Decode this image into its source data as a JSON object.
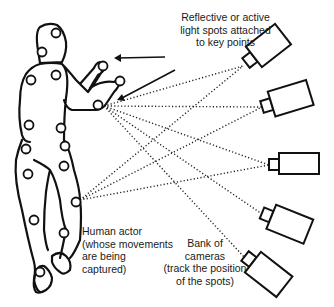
{
  "diagram": {
    "labels": {
      "markers": {
        "lines": [
          "Reflective or active",
          "light spots attached",
          "to key points"
        ]
      },
      "actor": {
        "lines": [
          "Human actor",
          "(whose movements",
          "are being",
          "captured)"
        ]
      },
      "cameras": {
        "lines": [
          "Bank of",
          "cameras",
          "(track the position",
          "of the spots)"
        ]
      }
    },
    "elements": {
      "actor_figure": "human-actor-outline",
      "marker_count": 15,
      "camera_count": 5,
      "sight_lines": "dotted lines from cameras to hand marker and leg marker"
    },
    "colors": {
      "ink": "#111111",
      "background": "#ffffff"
    }
  }
}
